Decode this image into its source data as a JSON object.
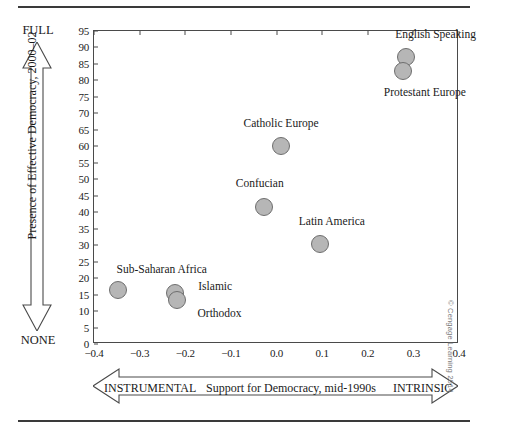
{
  "chart_data": {
    "type": "scatter",
    "title": "",
    "xlabel": "Support for Democracy, mid-1990s",
    "ylabel": "Presence of Effective Democracy, 2000–02",
    "xlim": [
      -0.4,
      0.4
    ],
    "ylim": [
      0,
      95
    ],
    "xticks": [
      "−0.4",
      "−0.3",
      "−0.2",
      "−0.1",
      "0.0",
      "0.1",
      "0.2",
      "0.3",
      "0.4"
    ],
    "xtick_values": [
      -0.4,
      -0.3,
      -0.2,
      -0.1,
      0.0,
      0.1,
      0.2,
      0.3,
      0.4
    ],
    "yticks": [
      "0",
      "5",
      "10",
      "15",
      "20",
      "25",
      "30",
      "35",
      "40",
      "45",
      "50",
      "55",
      "60",
      "65",
      "70",
      "75",
      "80",
      "85",
      "90",
      "95"
    ],
    "ytick_values": [
      0,
      5,
      10,
      15,
      20,
      25,
      30,
      35,
      40,
      45,
      50,
      55,
      60,
      65,
      70,
      75,
      80,
      85,
      90,
      95
    ],
    "grid": false,
    "legend": "none",
    "points": [
      {
        "label": "English Speaking",
        "x": 0.283,
        "y": 87.0,
        "r": 9,
        "label_dx": 30,
        "label_dy": -22,
        "anchor": "mid"
      },
      {
        "label": "Protestant Europe",
        "x": 0.277,
        "y": 83.0,
        "r": 9,
        "label_dx": 22,
        "label_dy": 22,
        "anchor": "mid"
      },
      {
        "label": "Catholic Europe",
        "x": 0.01,
        "y": 60.0,
        "r": 9,
        "label_dx": 0,
        "label_dy": -22,
        "anchor": "mid"
      },
      {
        "label": "Confucian",
        "x": -0.028,
        "y": 41.5,
        "r": 9,
        "label_dx": -4,
        "label_dy": -23,
        "anchor": "mid"
      },
      {
        "label": "Latin America",
        "x": 0.095,
        "y": 30.5,
        "r": 9,
        "label_dx": 12,
        "label_dy": -22,
        "anchor": "mid"
      },
      {
        "label": "Sub-Saharan Africa",
        "x": -0.348,
        "y": 16.5,
        "r": 9,
        "label_dx": 44,
        "label_dy": -20,
        "anchor": "mid"
      },
      {
        "label": "Islamic",
        "x": -0.222,
        "y": 15.5,
        "r": 9,
        "label_dx": 40,
        "label_dy": -6,
        "anchor": "mid"
      },
      {
        "label": "Orthodox",
        "x": -0.219,
        "y": 13.5,
        "r": 9,
        "label_dx": 43,
        "label_dy": 14,
        "anchor": "mid"
      }
    ]
  },
  "axes": {
    "y_top_label": "FULL",
    "y_bottom_label": "NONE",
    "x_left_label": "INSTRUMENTAL",
    "x_right_label": "INTRINSIC"
  },
  "credit": {
    "text": "© Cengage Learning 2014"
  },
  "colors": {
    "marker_fill": "#b6b6b6",
    "marker_stroke": "#6e6e6e",
    "axis": "#4a4a4a",
    "rule": "#3a3a3a",
    "text": "#1a1a1a"
  }
}
